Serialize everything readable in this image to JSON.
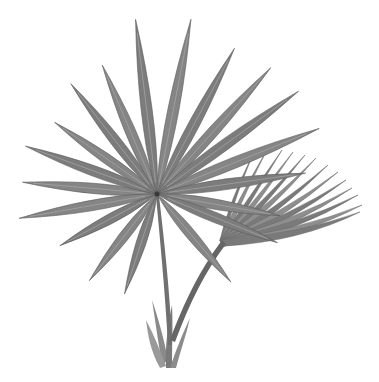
{
  "image": {
    "subject": "fan palm botanical illustration",
    "style": "grayscale",
    "width": 379,
    "height": 382,
    "background": "#ffffff",
    "colors": {
      "leaf_dark": "#5a5a5a",
      "leaf_mid": "#7c7c7c",
      "leaf_light": "#a8a8a8",
      "stem": "#707070"
    },
    "palm_center": [
      157,
      194
    ],
    "main_frond_leaflets": [
      {
        "angle": -175,
        "length": 135
      },
      {
        "angle": -160,
        "length": 140
      },
      {
        "angle": -145,
        "length": 125
      },
      {
        "angle": -128,
        "length": 140
      },
      {
        "angle": -113,
        "length": 140
      },
      {
        "angle": -97,
        "length": 176
      },
      {
        "angle": -79,
        "length": 178
      },
      {
        "angle": -62,
        "length": 165
      },
      {
        "angle": -48,
        "length": 170
      },
      {
        "angle": -36,
        "length": 175
      },
      {
        "angle": -22,
        "length": 175
      },
      {
        "angle": -8,
        "length": 150
      },
      {
        "angle": 10,
        "length": 125
      },
      {
        "angle": 22,
        "length": 130
      },
      {
        "angle": 50,
        "length": 115
      },
      {
        "angle": 108,
        "length": 105
      },
      {
        "angle": 128,
        "length": 110
      },
      {
        "angle": 152,
        "length": 110
      },
      {
        "angle": 170,
        "length": 140
      }
    ],
    "secondary_frond_tips": [
      [
        255,
        150
      ],
      [
        268,
        148
      ],
      [
        282,
        150
      ],
      [
        293,
        152
      ],
      [
        305,
        155
      ],
      [
        316,
        158
      ],
      [
        328,
        165
      ],
      [
        338,
        172
      ],
      [
        346,
        180
      ],
      [
        352,
        188
      ],
      [
        358,
        195
      ],
      [
        362,
        205
      ],
      [
        360,
        212
      ]
    ],
    "secondary_frond_base": [
      220,
      240
    ]
  }
}
